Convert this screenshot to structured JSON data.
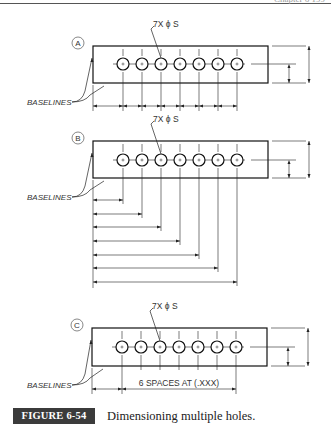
{
  "header": {
    "running_head": "Chapter 6   199"
  },
  "figure": {
    "label": "FIGURE 6-54",
    "caption": "Dimensioning multiple holes.",
    "label_bg": "#3b3b3b"
  },
  "views": [
    {
      "id": "A",
      "marker": "A",
      "callout": "7X ϕ S",
      "baselines_label": "BASELINES",
      "method": "chain",
      "rect": {
        "x": 93,
        "y": 46,
        "w": 175,
        "h": 37
      },
      "hole_y": 64,
      "holes_x": [
        123,
        142,
        161,
        180,
        199,
        218,
        237
      ],
      "dim_y": 106
    },
    {
      "id": "B",
      "marker": "B",
      "callout": "7X ϕ S",
      "baselines_label": "BASELINES",
      "method": "baseline",
      "rect": {
        "x": 93,
        "y": 141,
        "w": 175,
        "h": 37
      },
      "hole_y": 160,
      "holes_x": [
        123,
        142,
        161,
        180,
        199,
        218,
        237
      ],
      "dim_ys": [
        200,
        214,
        227,
        241,
        255,
        268,
        282
      ]
    },
    {
      "id": "C",
      "marker": "C",
      "callout": "7X ϕ S",
      "baselines_label": "BASELINES",
      "method": "spaces",
      "rect": {
        "x": 92,
        "y": 328,
        "w": 175,
        "h": 38
      },
      "hole_y": 347,
      "holes_x": [
        122,
        141,
        160,
        179,
        198,
        217,
        236
      ],
      "dim_y": 389,
      "spaces_text": "6 SPACES AT (.XXX)"
    }
  ]
}
